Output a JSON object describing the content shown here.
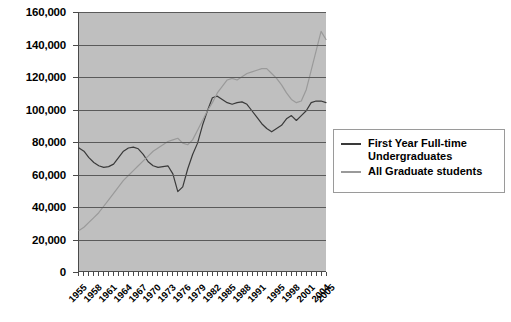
{
  "chart_data": {
    "type": "line",
    "title": "",
    "xlabel": "",
    "ylabel": "",
    "ylim": [
      0,
      160000
    ],
    "ytick_step": 20000,
    "grid": true,
    "legend_position": "right",
    "ytick_labels": [
      "160,000",
      "140,000",
      "120,000",
      "100,000",
      "80,000",
      "60,000",
      "40,000",
      "20,000",
      "0"
    ],
    "xtick_labels": [
      "1955",
      "1958",
      "1961",
      "1964",
      "1967",
      "1970",
      "1973",
      "1976",
      "1979",
      "1982",
      "1985",
      "1988",
      "1991",
      "1995",
      "1998",
      "2001",
      "2004",
      "2005"
    ],
    "x": [
      1955,
      1956,
      1957,
      1958,
      1959,
      1960,
      1961,
      1962,
      1963,
      1964,
      1965,
      1966,
      1967,
      1968,
      1969,
      1970,
      1971,
      1972,
      1973,
      1974,
      1975,
      1976,
      1977,
      1978,
      1979,
      1980,
      1981,
      1982,
      1983,
      1984,
      1985,
      1986,
      1987,
      1988,
      1989,
      1990,
      1991,
      1992,
      1993,
      1994,
      1995,
      1996,
      1997,
      1998,
      1999,
      2000,
      2001,
      2002,
      2003,
      2004,
      2005
    ],
    "series": [
      {
        "name": "First Year Full-time Undergraduates",
        "color": "#3a3a3a",
        "values": [
          76000,
          74000,
          70000,
          67000,
          65000,
          64000,
          64500,
          66000,
          70000,
          74000,
          76000,
          76500,
          75500,
          72000,
          67500,
          65000,
          64000,
          64500,
          65000,
          60000,
          49000,
          52000,
          63000,
          72000,
          79000,
          90000,
          99000,
          107000,
          108000,
          106000,
          104000,
          103000,
          104000,
          104500,
          103000,
          99000,
          95000,
          91000,
          88000,
          86000,
          88000,
          90000,
          94000,
          96000,
          93000,
          96000,
          99000,
          104000,
          105000,
          105000,
          104000
        ]
      },
      {
        "name": "All Graduate students",
        "color": "#9a9a9a",
        "values": [
          25000,
          27000,
          30000,
          33000,
          36000,
          40000,
          44000,
          48000,
          52000,
          56000,
          59000,
          62000,
          65000,
          68000,
          71000,
          74000,
          76000,
          78000,
          80000,
          81000,
          82000,
          79000,
          78000,
          81000,
          87000,
          93000,
          99000,
          104000,
          110000,
          114000,
          118000,
          119000,
          118000,
          120000,
          122000,
          123000,
          124000,
          125000,
          125000,
          122000,
          119000,
          115000,
          110000,
          106000,
          104000,
          105000,
          112000,
          124000,
          136000,
          148000,
          143000
        ]
      }
    ]
  },
  "legend": {
    "items": [
      {
        "label_line1": "First Year Full-time",
        "label_line2": "Undergraduates",
        "color": "#3a3a3a"
      },
      {
        "label_line1": "All Graduate students",
        "label_line2": "",
        "color": "#9a9a9a"
      }
    ]
  }
}
